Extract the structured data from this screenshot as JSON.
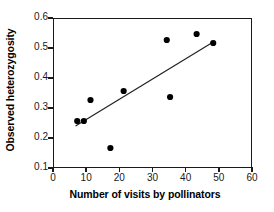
{
  "chart_data": {
    "type": "scatter",
    "title": "",
    "xlabel": "Number of visits by pollinators",
    "ylabel": "Observed heterozygosity",
    "xlim": [
      0,
      60
    ],
    "ylim": [
      0.1,
      0.6
    ],
    "xticks": [
      "0",
      "10",
      "20",
      "30",
      "40",
      "50",
      "60"
    ],
    "xtick_values": [
      0,
      10,
      20,
      30,
      40,
      50,
      60
    ],
    "yticks": [
      "0.1",
      "0.2",
      "0.3",
      "0.4",
      "0.5",
      "0.6"
    ],
    "ytick_values": [
      0.1,
      0.2,
      0.3,
      0.4,
      0.5,
      0.6
    ],
    "grid": false,
    "legend": null,
    "marker": "filled-circle",
    "marker_color": "#000000",
    "points": [
      {
        "x": 7,
        "y": 0.26
      },
      {
        "x": 9,
        "y": 0.26
      },
      {
        "x": 11,
        "y": 0.33
      },
      {
        "x": 17,
        "y": 0.17
      },
      {
        "x": 21,
        "y": 0.36
      },
      {
        "x": 34,
        "y": 0.53
      },
      {
        "x": 35,
        "y": 0.34
      },
      {
        "x": 43,
        "y": 0.55
      },
      {
        "x": 48,
        "y": 0.52
      }
    ],
    "trendline": {
      "type": "linear-fit",
      "color": "#222222",
      "x_start": 6.5,
      "y_start": 0.243,
      "x_end": 48.5,
      "y_end": 0.527
    }
  }
}
